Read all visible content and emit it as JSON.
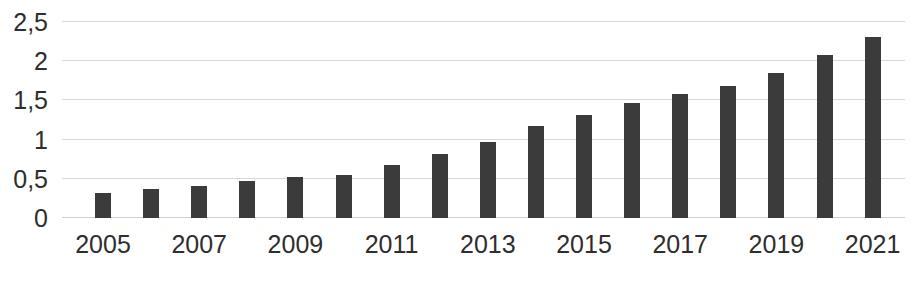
{
  "chart_data": {
    "type": "bar",
    "title": "",
    "subtitle": "",
    "xlabel": "",
    "ylabel": "",
    "categories": [
      "2005",
      "2006",
      "2007",
      "2008",
      "2009",
      "2010",
      "2011",
      "2012",
      "2013",
      "2014",
      "2015",
      "2016",
      "2017",
      "2018",
      "2019",
      "2020",
      "2021"
    ],
    "values": [
      0.32,
      0.37,
      0.41,
      0.47,
      0.52,
      0.55,
      0.67,
      0.82,
      0.97,
      1.17,
      1.31,
      1.47,
      1.58,
      1.68,
      1.85,
      2.08,
      2.31
    ],
    "visible_tick_labels": [
      "2005",
      "2007",
      "2009",
      "2011",
      "2013",
      "2015",
      "2017",
      "2019",
      "2021"
    ],
    "ylim": [
      0,
      2.5
    ],
    "ytick_values": [
      0,
      0.5,
      1,
      1.5,
      2,
      2.5
    ],
    "ytick_labels": [
      "0",
      "0,5",
      "1",
      "1,5",
      "2",
      "2,5"
    ],
    "grid": true,
    "legend": false,
    "legend_position": "none",
    "bar_color": "#3b3b3b",
    "gridline_color": "#d9d9d9",
    "background_color": "#ffffff",
    "tick_label_color": "#2e2e2e",
    "decimal_separator": ","
  }
}
